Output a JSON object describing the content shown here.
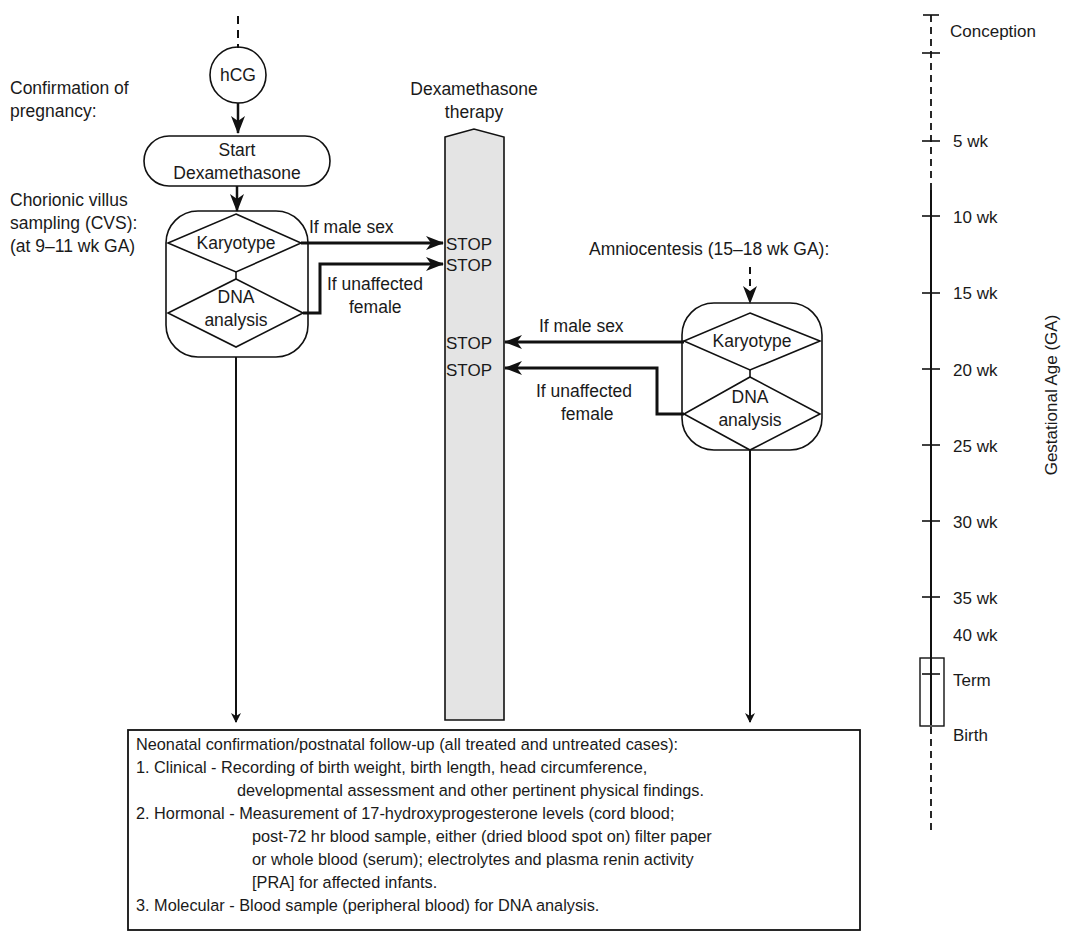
{
  "left_labels": {
    "confirmation": [
      "Confirmation of",
      "pregnancy:"
    ],
    "cvs": [
      "Chorionic villus",
      "sampling (CVS):",
      "(at 9–11 wk GA)"
    ]
  },
  "nodes": {
    "hcg": "hCG",
    "start_dex": [
      "Start",
      "Dexamethasone"
    ],
    "cvs_karyotype": "Karyotype",
    "cvs_dna": [
      "DNA",
      "analysis"
    ],
    "amnio_karyotype": "Karyotype",
    "amnio_dna": [
      "DNA",
      "analysis"
    ]
  },
  "therapy": {
    "title": [
      "Dexamethasone",
      "therapy"
    ],
    "stop_label": "STOP",
    "fill_color": "#e4e4e4"
  },
  "edges": {
    "cvs_male": "If male sex",
    "cvs_unaffected": [
      "If unaffected",
      "female"
    ],
    "amnio_male": "If male sex",
    "amnio_unaffected": [
      "If unaffected",
      "female"
    ]
  },
  "amnio_label": "Amniocentesis (15–18 wk GA):",
  "timeline": {
    "axis_title": "Gestational Age (GA)",
    "ticks": [
      {
        "label": "Conception"
      },
      {
        "label": "5 wk"
      },
      {
        "label": "10 wk"
      },
      {
        "label": "15 wk"
      },
      {
        "label": "20 wk"
      },
      {
        "label": "25 wk"
      },
      {
        "label": "30 wk"
      },
      {
        "label": "35 wk"
      },
      {
        "label": "40 wk"
      },
      {
        "label": "Term"
      },
      {
        "label": "Birth"
      }
    ]
  },
  "followup": {
    "title": "Neonatal confirmation/postnatal follow-up (all treated and untreated cases):",
    "items": [
      {
        "head": "1. Clinical - Recording of birth weight, birth length, head circumference,",
        "cont": [
          "developmental assessment and other pertinent physical findings."
        ]
      },
      {
        "head": "2. Hormonal - Measurement of 17-hydroxyprogesterone levels (cord blood;",
        "cont": [
          "post-72 hr blood sample, either (dried blood spot on) filter paper",
          "or whole blood (serum); electrolytes and plasma renin activity",
          "[PRA] for affected infants."
        ]
      },
      {
        "head": "3. Molecular - Blood sample (peripheral blood) for DNA analysis.",
        "cont": []
      }
    ]
  }
}
